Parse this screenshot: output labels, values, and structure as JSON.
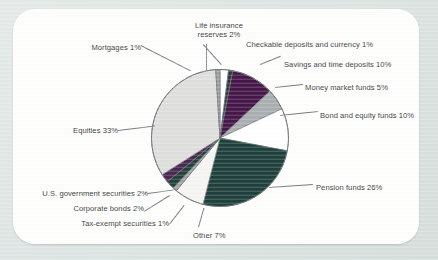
{
  "chart_data": {
    "type": "pie",
    "title": "",
    "start_angle_deg": 0,
    "direction": "clockwise",
    "legend": "none",
    "grid": false,
    "categories": [
      "Life insurance reserves",
      "Checkable deposits and currency",
      "Savings and time deposits",
      "Money market funds",
      "Bond and equity funds",
      "Pension funds",
      "Other",
      "Tax-exempt securities",
      "Corporate bonds",
      "U.S. government securities",
      "Equities",
      "Mortgages"
    ],
    "values": [
      2,
      1,
      10,
      5,
      10,
      26,
      7,
      1,
      2,
      2,
      33,
      1
    ],
    "unit": "%",
    "colors": [
      "#ffffff",
      "#2a3b38",
      "#46184a",
      "#a9aeb0",
      "#ffffff",
      "#1f403c",
      "#f4f4f3",
      "#9fa5a6",
      "#24403b",
      "#4a2750",
      "#dedfdd",
      "#9ea4a5"
    ],
    "slices": [
      {
        "label": "Life insurance reserves 2%",
        "name": "Life insurance reserves",
        "value": 2,
        "color": "#ffffff"
      },
      {
        "label": "Checkable deposits and currency  1%",
        "name": "Checkable deposits and currency",
        "value": 1,
        "color": "#2a3b38"
      },
      {
        "label": "Savings and time deposits  10%",
        "name": "Savings and time deposits",
        "value": 10,
        "color": "#46184a"
      },
      {
        "label": "Money market funds 5%",
        "name": "Money market funds",
        "value": 5,
        "color": "#a9aeb0"
      },
      {
        "label": "Bond and equity funds 10%",
        "name": "Bond and equity funds",
        "value": 10,
        "color": "#ffffff"
      },
      {
        "label": "Pension funds 26%",
        "name": "Pension funds",
        "value": 26,
        "color": "#1f403c"
      },
      {
        "label": "Other 7%",
        "name": "Other",
        "value": 7,
        "color": "#f4f4f3"
      },
      {
        "label": "Tax-exempt securities 1%",
        "name": "Tax-exempt securities",
        "value": 1,
        "color": "#9fa5a6"
      },
      {
        "label": "Corporate bonds 2%",
        "name": "Corporate bonds",
        "value": 2,
        "color": "#24403b"
      },
      {
        "label": "U.S. government securities 2%",
        "name": "U.S. government securities",
        "value": 2,
        "color": "#4a2750"
      },
      {
        "label": "Equities 33%",
        "name": "Equities",
        "value": 33,
        "color": "#dedfdd"
      },
      {
        "label": "Mortgages 1%",
        "name": "Mortgages",
        "value": 1,
        "color": "#9ea4a5"
      }
    ]
  },
  "labels": {
    "life_insurance": "Life insurance reserves 2%",
    "checkable": "Checkable deposits and currency  1%",
    "savings": "Savings and time deposits  10%",
    "money_market": "Money market funds 5%",
    "bond_equity": "Bond and equity funds 10%",
    "pension": "Pension funds 26%",
    "other": "Other 7%",
    "tax_exempt": "Tax-exempt securities 1%",
    "corporate": "Corporate bonds 2%",
    "us_gov": "U.S. government securities 2%",
    "equities": "Equities 33%",
    "mortgages": "Mortgages 1%"
  },
  "style": {
    "page_background": "#dfe6e4",
    "card_background": "#fdfdfc",
    "text_color": "#3a3f41",
    "leader_color": "#777d7e",
    "slice_outline": "#6e7476"
  }
}
